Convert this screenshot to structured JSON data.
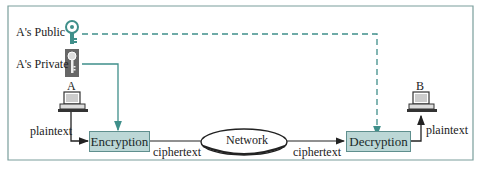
{
  "keys": {
    "public_label": "A's Public",
    "private_label": "A's Private"
  },
  "sender": {
    "label": "A",
    "plaintext_label": "plaintext"
  },
  "receiver": {
    "label": "B",
    "plaintext_label": "plaintext"
  },
  "encryption": {
    "label": "Encryption"
  },
  "decryption": {
    "label": "Decryption"
  },
  "network": {
    "label": "Network"
  },
  "ciphertext_left": "ciphertext",
  "ciphertext_right": "ciphertext",
  "colors": {
    "teal_line": "#3f8f8a",
    "box_fill": "#bcd7d6",
    "frame": "#7a9e9c",
    "arrow": "#222222"
  }
}
